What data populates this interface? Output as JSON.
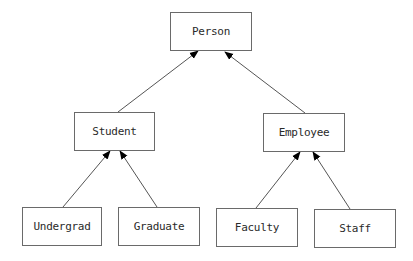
{
  "diagram": {
    "type": "class-hierarchy",
    "nodes": {
      "person": {
        "label": "Person",
        "x": 170,
        "y": 12,
        "w": 82,
        "h": 39
      },
      "student": {
        "label": "Student",
        "x": 74,
        "y": 112,
        "w": 81,
        "h": 39
      },
      "employee": {
        "label": "Employee",
        "x": 263,
        "y": 113,
        "w": 82,
        "h": 39
      },
      "undergrad": {
        "label": "Undergrad",
        "x": 22,
        "y": 207,
        "w": 80,
        "h": 39
      },
      "graduate": {
        "label": "Graduate",
        "x": 118,
        "y": 207,
        "w": 82,
        "h": 39
      },
      "faculty": {
        "label": "Faculty",
        "x": 216,
        "y": 208,
        "w": 82,
        "h": 39
      },
      "staff": {
        "label": "Staff",
        "x": 314,
        "y": 209,
        "w": 82,
        "h": 39
      }
    },
    "edges": [
      {
        "from": "Student",
        "to": "Person",
        "x1": 118,
        "y1": 112,
        "x2": 198,
        "y2": 51
      },
      {
        "from": "Employee",
        "to": "Person",
        "x1": 305,
        "y1": 113,
        "x2": 225,
        "y2": 52
      },
      {
        "from": "Undergrad",
        "to": "Student",
        "x1": 63,
        "y1": 207,
        "x2": 110,
        "y2": 151
      },
      {
        "from": "Graduate",
        "to": "Student",
        "x1": 157,
        "y1": 207,
        "x2": 120,
        "y2": 151
      },
      {
        "from": "Faculty",
        "to": "Employee",
        "x1": 256,
        "y1": 208,
        "x2": 300,
        "y2": 152
      },
      {
        "from": "Staff",
        "to": "Employee",
        "x1": 350,
        "y1": 209,
        "x2": 313,
        "y2": 152
      }
    ],
    "colors": {
      "border": "#6a6a6a",
      "text": "#2a2a2a",
      "edge": "#555555",
      "arrowhead": "#000000"
    }
  }
}
